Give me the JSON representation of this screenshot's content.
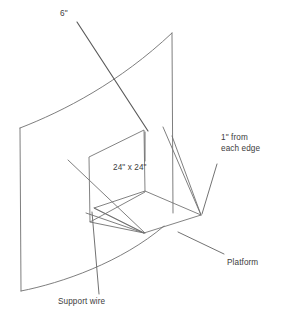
{
  "diagram": {
    "background_color": "#ffffff",
    "line_color": "#6f6f6f",
    "text_color": "#3c3c3c",
    "labels": {
      "top_dimension": "6\"",
      "panel_dimension": "24\" x 24\"",
      "edge_offset_line1": "1\" from",
      "edge_offset_line2": "each edge",
      "platform": "Platform",
      "support_wire": "Support wire"
    },
    "callouts": [
      {
        "name": "six-inch-callout",
        "text": "6\"",
        "leader_from": [
          77,
          22
        ],
        "leader_to": [
          148,
          131
        ]
      },
      {
        "name": "panel-size-callout",
        "text": "24\" x 24\"",
        "leader_from": [
          145,
          160
        ],
        "leader_to": [
          145,
          132
        ]
      },
      {
        "name": "edge-offset-callout",
        "text": "1\" from each edge",
        "leader_from": [
          217,
          163
        ],
        "leader_to": [
          202,
          214
        ]
      },
      {
        "name": "platform-callout",
        "text": "Platform",
        "leader_from": [
          224,
          255
        ],
        "leader_to": [
          178,
          232
        ]
      },
      {
        "name": "support-wire-callout",
        "text": "Support wire",
        "leader_from": [
          99,
          294
        ],
        "leader_to": [
          92,
          212
        ]
      }
    ],
    "geometry": {
      "curved_sheet": {
        "name": "curved-backing-sheet",
        "left_edge": [
          [
            20,
            128
          ],
          [
            21,
            291
          ]
        ],
        "right_edge": [
          [
            172,
            33
          ],
          [
            173,
            212
          ]
        ],
        "top_curve": "M20,128 C70,108 130,76 172,33",
        "bottom_curve": "M21,291 C70,281 126,258 163,226"
      },
      "platform": {
        "name": "platform-parallelogram",
        "corners": [
          [
            145,
            191
          ],
          [
            201,
            215
          ],
          [
            144,
            233
          ],
          [
            94,
            208
          ]
        ]
      },
      "vertical_panel": {
        "name": "vertical-panel-24x24",
        "top_corner": [
          144,
          130
        ],
        "left_corner": [
          89,
          157
        ],
        "left_vertical": [
          [
            89,
            157
          ],
          [
            90,
            222
          ]
        ],
        "right_vertical": [
          [
            144,
            130
          ],
          [
            145,
            192
          ]
        ]
      },
      "wires": [
        {
          "name": "wire-upper-right-a",
          "from": [
            163,
            127
          ],
          "to": [
            201,
            215
          ]
        },
        {
          "name": "wire-upper-right-b",
          "from": [
            172,
            136
          ],
          "to": [
            201,
            215
          ]
        },
        {
          "name": "wire-lower-left-a",
          "from": [
            86,
            213
          ],
          "to": [
            144,
            233
          ]
        },
        {
          "name": "wire-lower-left-b",
          "from": [
            90,
            222
          ],
          "to": [
            144,
            233
          ]
        },
        {
          "name": "wire-long-diagonal",
          "from": [
            68,
            160
          ],
          "to": [
            144,
            233
          ]
        },
        {
          "name": "wire-platform-back",
          "from": [
            94,
            208
          ],
          "to": [
            145,
            191
          ]
        }
      ]
    }
  }
}
